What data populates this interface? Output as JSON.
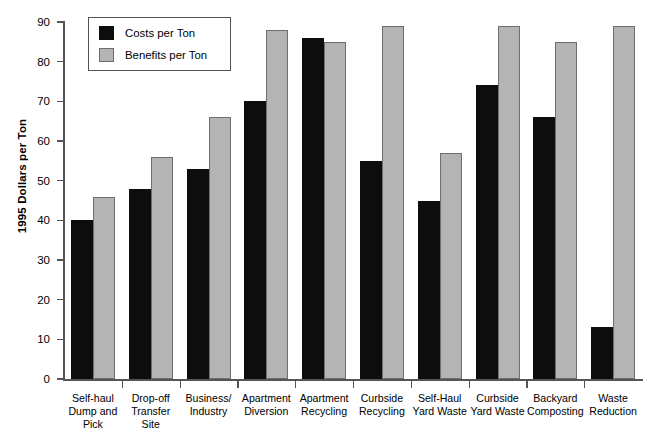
{
  "chart_data": {
    "type": "bar",
    "title": "",
    "xlabel": "",
    "ylabel": "1995 Dollars per Ton",
    "ylim": [
      0,
      90
    ],
    "ytick_interval": 10,
    "yticks": [
      90,
      80,
      70,
      60,
      50,
      40,
      30,
      20,
      10,
      0
    ],
    "grid": false,
    "legend_position": "top-left-inside",
    "categories": [
      "Self-haul\nDump and\nPick",
      "Drop-off\nTransfer Site",
      "Business/\nIndustry",
      "Apartment\nDiversion",
      "Apartment\nRecycling",
      "Curbside\nRecycling",
      "Self-Haul\nYard Waste",
      "Curbside\nYard Waste",
      "Backyard\nComposting",
      "Waste\nReduction"
    ],
    "series": [
      {
        "name": "Costs per Ton",
        "color": "#0d0d0d",
        "values": [
          40,
          48,
          53,
          70,
          86,
          55,
          45,
          74,
          66,
          13
        ]
      },
      {
        "name": "Benefits per Ton",
        "color": "#b4b4b4",
        "values": [
          46,
          56,
          66,
          88,
          85,
          89,
          57,
          89,
          85,
          89
        ]
      }
    ]
  },
  "legend": {
    "items": [
      {
        "label": "Costs per Ton"
      },
      {
        "label": "Benefits per Ton"
      }
    ]
  },
  "colors": {
    "costs": "#0d0d0d",
    "benefits": "#b4b4b4",
    "axis": "#555555",
    "background": "#ffffff"
  }
}
